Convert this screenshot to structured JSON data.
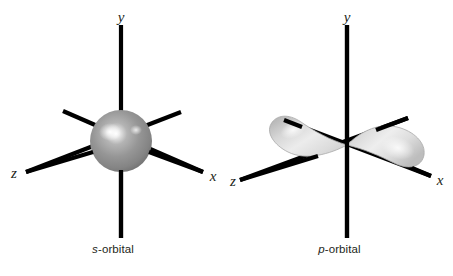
{
  "figure": {
    "background_color": "#ffffff",
    "width": 453,
    "height": 276,
    "axis_color": "#000000",
    "label_color": "#231f20"
  },
  "panels": [
    {
      "id": "s-orbital",
      "caption_symbol": "s",
      "caption_rest": "-orbital",
      "shape": "sphere",
      "shape_fill": "#8f8f8f",
      "shape_highlight": "#ffffff",
      "axes": [
        {
          "name": "y",
          "label": "y",
          "direction": "up"
        },
        {
          "name": "x",
          "label": "x",
          "direction": "down-right"
        },
        {
          "name": "z",
          "label": "z",
          "direction": "down-left"
        }
      ],
      "axis_labels": {
        "y": "y",
        "x": "x",
        "z": "z"
      }
    },
    {
      "id": "p-orbital",
      "caption_symbol": "p",
      "caption_rest": "-orbital",
      "shape": "two-lobes",
      "shape_fill": "#d2d2d2",
      "shape_highlight": "#f2f2f2",
      "axes": [
        {
          "name": "y",
          "label": "y",
          "direction": "up"
        },
        {
          "name": "x",
          "label": "x",
          "direction": "down-right"
        },
        {
          "name": "z",
          "label": "z",
          "direction": "down-left"
        }
      ],
      "axis_labels": {
        "y": "y",
        "x": "x",
        "z": "z"
      }
    }
  ]
}
